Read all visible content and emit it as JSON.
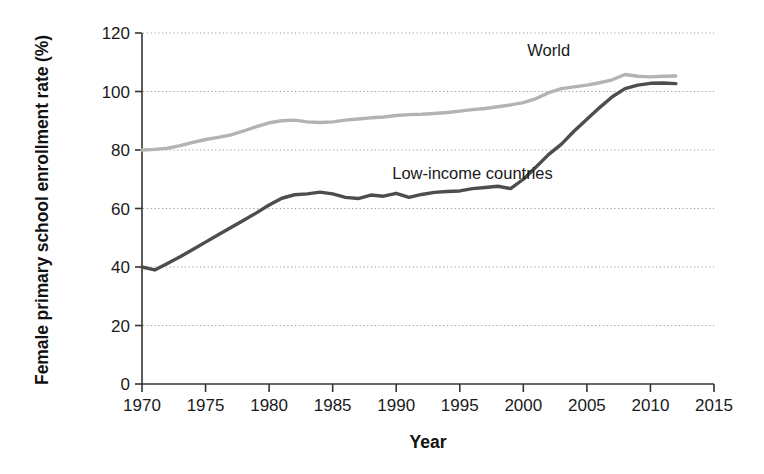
{
  "chart_data": {
    "type": "line",
    "title": "",
    "xlabel": "Year",
    "ylabel": "Female primary school enrollment rate (%)",
    "xlim": [
      1970,
      2015
    ],
    "ylim": [
      0,
      120
    ],
    "grid": true,
    "legend_position": "inline-annotation",
    "x_ticks": [
      "1970",
      "1975",
      "1980",
      "1985",
      "1990",
      "1995",
      "2000",
      "2005",
      "2010",
      "2015"
    ],
    "y_ticks": [
      "0",
      "20",
      "40",
      "60",
      "80",
      "100",
      "120"
    ],
    "x": [
      1970,
      1971,
      1972,
      1973,
      1974,
      1975,
      1976,
      1977,
      1978,
      1979,
      1980,
      1981,
      1982,
      1983,
      1984,
      1985,
      1986,
      1987,
      1988,
      1989,
      1990,
      1991,
      1992,
      1993,
      1994,
      1995,
      1996,
      1997,
      1998,
      1999,
      2000,
      2001,
      2002,
      2003,
      2004,
      2005,
      2006,
      2007,
      2008,
      2009,
      2010,
      2011,
      2012
    ],
    "series": [
      {
        "name": "World",
        "color": "#b3b3b3",
        "label_x": 2002,
        "label_y": 112,
        "values": [
          80.0,
          80.2,
          80.6,
          81.5,
          82.6,
          83.6,
          84.3,
          85.2,
          86.5,
          88.0,
          89.3,
          90.0,
          90.2,
          89.6,
          89.4,
          89.6,
          90.2,
          90.6,
          91.0,
          91.3,
          91.8,
          92.1,
          92.2,
          92.5,
          92.8,
          93.3,
          93.8,
          94.2,
          94.8,
          95.4,
          96.2,
          97.6,
          99.6,
          101.0,
          101.6,
          102.2,
          103.0,
          104.0,
          105.8,
          105.2,
          105.0,
          105.2,
          105.3
        ]
      },
      {
        "name": "Low-income countries",
        "color": "#4d4d4d",
        "label_x": 1996,
        "label_y": 70,
        "values": [
          40.0,
          39.0,
          41.2,
          43.5,
          46.0,
          48.5,
          51.0,
          53.5,
          56.0,
          58.5,
          61.2,
          63.5,
          64.7,
          65.0,
          65.6,
          65.0,
          63.8,
          63.4,
          64.6,
          64.2,
          65.2,
          63.8,
          64.8,
          65.5,
          65.8,
          66.0,
          66.8,
          67.2,
          67.6,
          66.8,
          70.0,
          74.2,
          78.5,
          82.0,
          86.5,
          90.5,
          94.5,
          98.2,
          101.0,
          102.2,
          102.8,
          102.9,
          102.7
        ]
      }
    ]
  }
}
